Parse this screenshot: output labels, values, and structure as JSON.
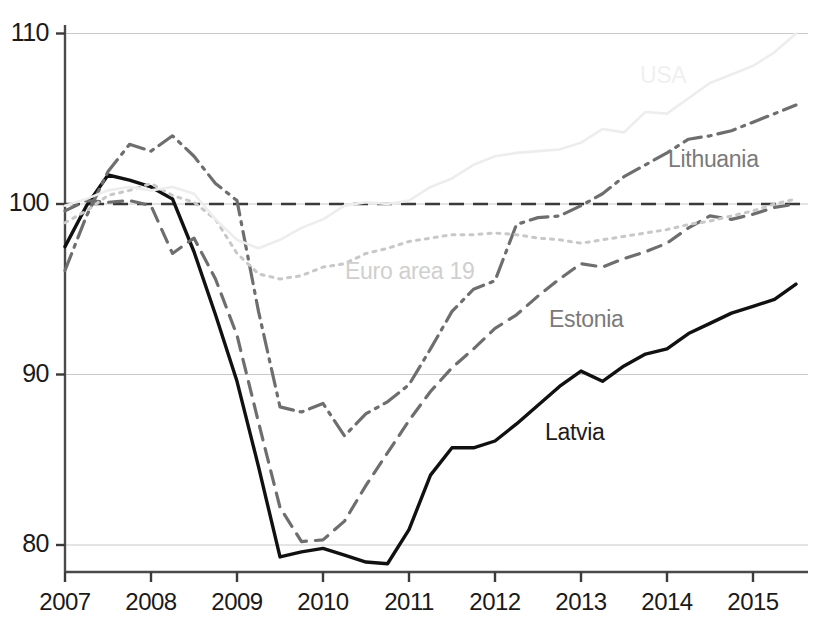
{
  "chart_data": {
    "type": "line",
    "title": "",
    "subtitle": "",
    "xlabel": "",
    "ylabel": "",
    "xlim": [
      2007.0,
      2015.5
    ],
    "ylim": [
      76.5,
      111.5
    ],
    "yticks": [
      80,
      90,
      100,
      110
    ],
    "ytick_labels": [
      "80",
      "90",
      "100",
      "110"
    ],
    "xticks": [
      2007,
      2008,
      2009,
      2010,
      2011,
      2012,
      2013,
      2014,
      2015
    ],
    "xtick_labels": [
      "2007",
      "2008",
      "2009",
      "2010",
      "2011",
      "2012",
      "2013",
      "2014",
      "2015"
    ],
    "grid": "horizontal",
    "legend_position": "inline-annotations",
    "reference_line": {
      "name": "baseline-100",
      "value": 100,
      "style": "dashed",
      "color": "#3a3a3a"
    },
    "x": [
      2007.0,
      2007.25,
      2007.5,
      2007.75,
      2008.0,
      2008.25,
      2008.5,
      2008.75,
      2009.0,
      2009.25,
      2009.5,
      2009.75,
      2010.0,
      2010.25,
      2010.5,
      2010.75,
      2011.0,
      2011.25,
      2011.5,
      2011.75,
      2012.0,
      2012.25,
      2012.5,
      2012.75,
      2013.0,
      2013.25,
      2013.5,
      2013.75,
      2014.0,
      2014.25,
      2014.5,
      2014.75,
      2015.0,
      2015.25,
      2015.5
    ],
    "series": [
      {
        "name": "Latvia",
        "label": "Latvia",
        "color": "#111111",
        "style": "solid",
        "width": 3.4,
        "label_x": 545,
        "label_y": 419,
        "label_color": "#1c1c1c",
        "values": [
          97.5,
          99.9,
          101.7,
          101.4,
          101.0,
          100.3,
          97.2,
          93.5,
          89.6,
          84.6,
          79.3,
          79.6,
          79.8,
          79.4,
          79.0,
          78.9,
          80.9,
          84.1,
          85.7,
          85.7,
          86.1,
          87.1,
          88.2,
          89.3,
          90.2,
          89.6,
          90.5,
          91.2,
          91.5,
          92.4,
          93.0,
          93.6,
          94.0,
          94.4,
          95.3
        ]
      },
      {
        "name": "Estonia",
        "label": "Estonia",
        "color": "#6e6e6e",
        "style": "dashed",
        "width": 3.2,
        "label_x": 549,
        "label_y": 306,
        "label_color": "#7a7a7a",
        "values": [
          99.6,
          100.2,
          100.1,
          100.2,
          99.9,
          97.1,
          98.0,
          95.6,
          92.3,
          87.2,
          82.2,
          80.2,
          80.3,
          81.4,
          83.5,
          85.4,
          87.3,
          89.0,
          90.4,
          91.5,
          92.7,
          93.5,
          94.6,
          95.6,
          96.5,
          96.3,
          96.8,
          97.2,
          97.7,
          98.6,
          99.3,
          99.1,
          99.4,
          99.8,
          100.0
        ]
      },
      {
        "name": "Lithuania",
        "label": "Lithuania",
        "color": "#6e6e6e",
        "style": "dashdot",
        "width": 3.2,
        "label_x": 668,
        "label_y": 146,
        "label_color": "#7a7a7a",
        "values": [
          96.1,
          99.3,
          101.9,
          103.5,
          103.1,
          104.0,
          102.8,
          101.2,
          100.2,
          93.7,
          88.1,
          87.8,
          88.3,
          86.4,
          87.7,
          88.4,
          89.4,
          91.5,
          93.7,
          95.0,
          95.5,
          98.8,
          99.2,
          99.3,
          99.9,
          100.6,
          101.6,
          102.3,
          103.0,
          103.8,
          104.0,
          104.3,
          104.8,
          105.3,
          105.8
        ]
      },
      {
        "name": "Euro area 19",
        "label": "Euro area 19",
        "color": "#c8c8c8",
        "style": "dotted",
        "width": 3.0,
        "label_x": 345,
        "label_y": 258,
        "label_color": "#cfcfcf",
        "values": [
          98.9,
          99.6,
          100.5,
          100.8,
          101.2,
          100.5,
          100.1,
          99.1,
          97.1,
          95.9,
          95.6,
          95.8,
          96.3,
          96.5,
          97.1,
          97.4,
          97.8,
          98.0,
          98.2,
          98.2,
          98.3,
          98.2,
          98.0,
          97.9,
          97.7,
          97.9,
          98.1,
          98.3,
          98.5,
          98.8,
          99.0,
          99.3,
          99.6,
          100.0,
          100.3
        ]
      },
      {
        "name": "USA",
        "label": "USA",
        "color": "#ededed",
        "style": "solid",
        "width": 2.6,
        "label_x": 640,
        "label_y": 62,
        "label_color": "#f0f0f0",
        "values": [
          99.9,
          100.3,
          100.8,
          101.0,
          100.8,
          101.0,
          100.6,
          99.1,
          97.9,
          97.4,
          97.9,
          98.6,
          99.1,
          99.9,
          100.1,
          100.0,
          100.2,
          101.0,
          101.5,
          102.3,
          102.8,
          103.0,
          103.1,
          103.2,
          103.6,
          104.4,
          104.2,
          105.4,
          105.3,
          106.2,
          107.1,
          107.6,
          108.1,
          108.9,
          110.0
        ]
      }
    ]
  },
  "axes": {
    "y_tick_values": [
      "110",
      "100",
      "90",
      "80"
    ],
    "x_tick_values": [
      "2007",
      "2008",
      "2009",
      "2010",
      "2011",
      "2012",
      "2013",
      "2014",
      "2015"
    ]
  }
}
